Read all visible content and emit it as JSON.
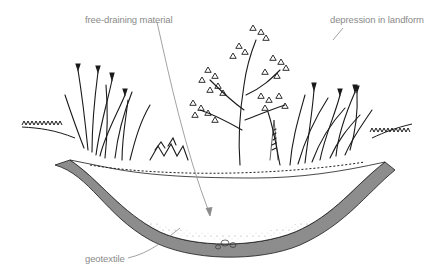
{
  "diagram": {
    "type": "rain garden cross-section illustration",
    "labels": {
      "free_draining_material": "free-draining material",
      "depression_in_landform": "depression in landform",
      "geotextile": "geotextile"
    },
    "colors": {
      "ink": "#1a1a1a",
      "label_text": "#8a8a8a",
      "leader_line": "#8a8a8a",
      "background": "#ffffff"
    }
  }
}
